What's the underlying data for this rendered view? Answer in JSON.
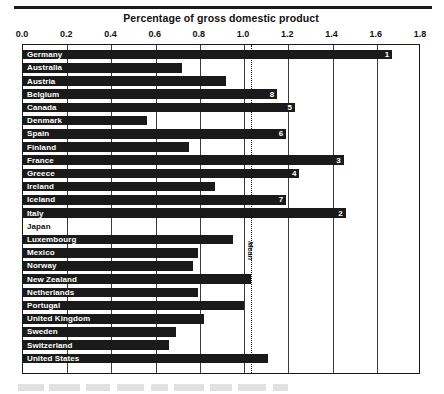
{
  "chart_data": {
    "type": "bar",
    "orientation": "horizontal",
    "title": "Percentage of gross domestic product",
    "xlabel": "",
    "ylabel": "",
    "xlim": [
      0.0,
      1.8
    ],
    "xticks": [
      "0.0",
      "0.2",
      "0.4",
      "0.6",
      "0.8",
      "1.0",
      "1.2",
      "1.4",
      "1.6",
      "1.8"
    ],
    "xtick_values": [
      0.0,
      0.2,
      0.4,
      0.6,
      0.8,
      1.0,
      1.2,
      1.4,
      1.6,
      1.8
    ],
    "grid": true,
    "legend": null,
    "annotations": [
      {
        "name": "mean-line",
        "label": "Mean",
        "value": 1.03,
        "style": "dotted-vertical"
      }
    ],
    "categories": [
      "Germany",
      "Australia",
      "Austria",
      "Belgium",
      "Canada",
      "Denmark",
      "Spain",
      "Finland",
      "France",
      "Greece",
      "Ireland",
      "Iceland",
      "Italy",
      "Japan",
      "Luxembourg",
      "Mexico",
      "Norway",
      "New Zealand",
      "Netherlands",
      "Portugal",
      "United Kingdom",
      "Sweden",
      "Switzerland",
      "United States"
    ],
    "values": [
      1.67,
      0.72,
      0.92,
      1.15,
      1.23,
      0.56,
      1.19,
      0.75,
      1.45,
      1.25,
      0.87,
      1.19,
      1.46,
      0.0,
      0.95,
      0.79,
      0.77,
      1.03,
      0.79,
      1.0,
      0.82,
      0.69,
      0.66,
      1.11
    ],
    "rank_labels": [
      "1",
      "",
      "",
      "8",
      "5",
      "",
      "6",
      "",
      "3",
      "4",
      "",
      "7",
      "2",
      "",
      "",
      "",
      "",
      "",
      "",
      "",
      "",
      "",
      "",
      ""
    ],
    "colors": {
      "bar": "#1a1a1a",
      "background": "#ffffff",
      "grid": "#3b3b3b",
      "frame": "#1a1a1a",
      "label_on_bar": "#ffffff",
      "label_off_bar": "#111111"
    }
  }
}
